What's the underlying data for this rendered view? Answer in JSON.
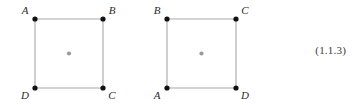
{
  "figure": {
    "caption_number": "(1.1.3)",
    "colors": {
      "edge": "#a8a8a8",
      "vertex_dot": "#111111",
      "center_dot": "#9a9a9a",
      "label_text": "#2b2b2b",
      "eq_text": "#3a3a3a",
      "background": "#ffffff"
    },
    "squares": [
      {
        "id": "square-left",
        "name": "square-unrotated",
        "geometry": {
          "left": 35,
          "top": 19,
          "right": 103,
          "bottom": 88
        },
        "center": {
          "x": 69,
          "y": 53.5
        },
        "vertices": [
          {
            "label": "A",
            "position": "top-left",
            "x": 35,
            "y": 19,
            "label_x": 25,
            "label_y": 14
          },
          {
            "label": "B",
            "position": "top-right",
            "x": 103,
            "y": 19,
            "label_x": 109,
            "label_y": 14
          },
          {
            "label": "C",
            "position": "bottom-right",
            "x": 103,
            "y": 88,
            "label_x": 109,
            "label_y": 98
          },
          {
            "label": "D",
            "position": "bottom-left",
            "x": 35,
            "y": 88,
            "label_x": 25,
            "label_y": 98
          }
        ]
      },
      {
        "id": "square-right",
        "name": "square-rotated",
        "geometry": {
          "left": 167,
          "top": 19,
          "right": 236,
          "bottom": 88
        },
        "center": {
          "x": 201.5,
          "y": 53.5
        },
        "vertices": [
          {
            "label": "B",
            "position": "top-left",
            "x": 167,
            "y": 19,
            "label_x": 157,
            "label_y": 14
          },
          {
            "label": "C",
            "position": "top-right",
            "x": 236,
            "y": 19,
            "label_x": 242,
            "label_y": 14
          },
          {
            "label": "D",
            "position": "bottom-right",
            "x": 236,
            "y": 88,
            "label_x": 242,
            "label_y": 98
          },
          {
            "label": "A",
            "position": "bottom-left",
            "x": 167,
            "y": 88,
            "label_x": 157,
            "label_y": 98
          }
        ]
      }
    ]
  }
}
